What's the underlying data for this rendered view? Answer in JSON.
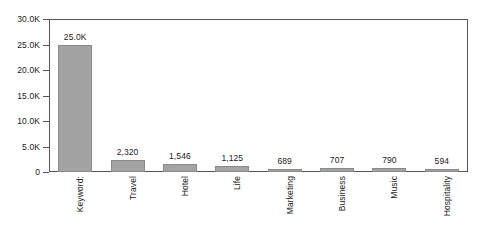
{
  "chart_data": {
    "type": "bar",
    "title": "",
    "xlabel": "",
    "ylabel": "",
    "categories": [
      "Keyword:",
      "Travel",
      "Hotel",
      "Life",
      "Marketing",
      "Business",
      "Music",
      "Hospitality"
    ],
    "values": [
      25000,
      2320,
      1546,
      1125,
      689,
      707,
      790,
      594
    ],
    "value_labels": [
      "25.0K",
      "2,320",
      "1,546",
      "1,125",
      "689",
      "707",
      "790",
      "594"
    ],
    "ylim": [
      0,
      30000
    ],
    "y_ticks": [
      0,
      5000,
      10000,
      15000,
      20000,
      25000,
      30000
    ],
    "y_tick_labels": [
      "0",
      "5.0K",
      "10.0K",
      "15.0K",
      "20.0K",
      "25.0K",
      "30.0K"
    ],
    "grid": false,
    "legend": null,
    "series": [
      {
        "name": "",
        "values": [
          25000,
          2320,
          1546,
          1125,
          689,
          707,
          790,
          594
        ]
      }
    ]
  },
  "style": {
    "bar_fill": "#a3a3a3",
    "bar_border": "#8a8a8a",
    "axis_color": "#555555",
    "text_color": "#1a1a1a",
    "background": "#ffffff"
  }
}
